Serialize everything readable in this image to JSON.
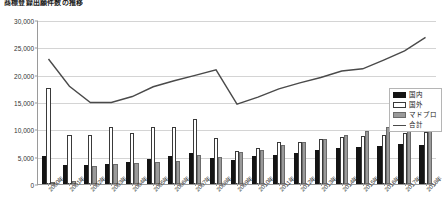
{
  "chart_title": "商標登録出願件数の推移",
  "legend": {
    "position": "right",
    "entries": [
      {
        "key": "domestic",
        "label": "国内",
        "icon": "black-bar-swatch"
      },
      {
        "key": "foreign",
        "label": "国外",
        "icon": "white-bar-swatch"
      },
      {
        "key": "madopro",
        "label": "マドプロ",
        "icon": "gray-bar-swatch"
      },
      {
        "key": "total",
        "label": "合計",
        "icon": "line-swatch"
      }
    ]
  },
  "axes": {
    "y_ticks": [
      "0",
      "5,000",
      "10,000",
      "15,000",
      "20,000",
      "25,000",
      "30,000"
    ],
    "x_ticks": [
      "2000年",
      "2001年",
      "2002年",
      "2003年",
      "2004年",
      "2005年",
      "2006年",
      "2007年",
      "2008年",
      "2009年",
      "2010年",
      "2011年",
      "2012年",
      "2013年",
      "2014年",
      "2015年",
      "2016年",
      "2017年",
      "2018年"
    ]
  },
  "chart_data": {
    "type": "bar",
    "title": "商標登録出願件数の推移",
    "xlabel": "",
    "ylabel": "",
    "ylim": [
      0,
      30000
    ],
    "y_ticks": [
      0,
      5000,
      10000,
      15000,
      20000,
      25000,
      30000
    ],
    "grid": true,
    "legend_position": "right",
    "categories": [
      "2000年",
      "2001年",
      "2002年",
      "2003年",
      "2004年",
      "2005年",
      "2006年",
      "2007年",
      "2008年",
      "2009年",
      "2010年",
      "2011年",
      "2012年",
      "2013年",
      "2014年",
      "2015年",
      "2016年",
      "2017年",
      "2018年"
    ],
    "series": [
      {
        "name": "国内",
        "type": "bar",
        "color": "#141414",
        "values": [
          5200,
          3400,
          3400,
          3600,
          4000,
          4600,
          5100,
          5600,
          4700,
          4400,
          5200,
          5300,
          5600,
          6200,
          6500,
          6700,
          7000,
          7300,
          7200
        ]
      },
      {
        "name": "国外",
        "type": "bar",
        "color": "#ffffff",
        "values": [
          17500,
          9000,
          9000,
          10400,
          9300,
          10400,
          10500,
          11900,
          8400,
          6000,
          6600,
          7600,
          7700,
          8200,
          8600,
          8700,
          9000,
          9400,
          9600
        ]
      },
      {
        "name": "マドプロ",
        "type": "bar",
        "color": "#9a9a9a",
        "values": [
          400,
          600,
          3300,
          3600,
          3800,
          4100,
          4300,
          5300,
          5000,
          5800,
          6300,
          7200,
          7600,
          8300,
          8900,
          9700,
          10400,
          11200,
          11900
        ]
      },
      {
        "name": "合計",
        "type": "line",
        "color": "#4a4a4a",
        "values": [
          23000,
          18000,
          15000,
          15000,
          16100,
          17900,
          19000,
          20000,
          21000,
          14700,
          16000,
          17500,
          18600,
          19600,
          20800,
          21200,
          22800,
          24500,
          27000
        ]
      }
    ]
  }
}
